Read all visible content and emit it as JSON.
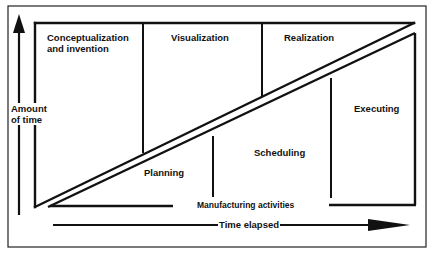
{
  "diagram": {
    "axes": {
      "y_label_line1": "Amount",
      "y_label_line2": "of time",
      "x_label": "Time elapsed"
    },
    "upper_region": {
      "description": "Design phases above the diagonal",
      "phases": [
        {
          "label_line1": "Conceptualization",
          "label_line2": "and invention"
        },
        {
          "label_line1": "Visualization"
        },
        {
          "label_line1": "Realization"
        }
      ]
    },
    "lower_region": {
      "description": "Manufacturing phases below the diagonal",
      "phases": [
        {
          "label": "Planning"
        },
        {
          "label": "Scheduling"
        },
        {
          "label": "Executing"
        }
      ],
      "baseline_label": "Manufacturing activities"
    },
    "colors": {
      "line": "#111111",
      "background": "#ffffff"
    }
  }
}
